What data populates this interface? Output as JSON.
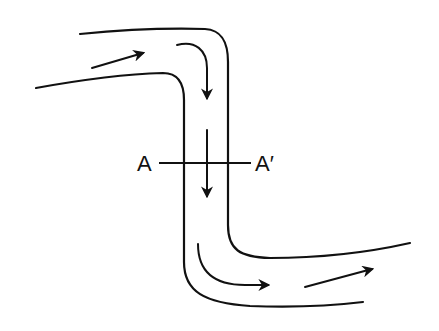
{
  "diagram": {
    "section_labels": {
      "left": "A",
      "right": "A′"
    },
    "elements": [
      {
        "name": "channel-wall-left",
        "kind": "channel boundary"
      },
      {
        "name": "channel-wall-right",
        "kind": "channel boundary"
      },
      {
        "name": "flow-arrow-inlet",
        "kind": "flow direction"
      },
      {
        "name": "flow-arrow-bend-top",
        "kind": "flow direction"
      },
      {
        "name": "flow-arrow-down",
        "kind": "flow direction"
      },
      {
        "name": "flow-arrow-bend-bottom",
        "kind": "flow direction"
      },
      {
        "name": "flow-arrow-outlet",
        "kind": "flow direction"
      },
      {
        "name": "cross-section-line",
        "kind": "section A-A′"
      }
    ],
    "colors": {
      "stroke": "#111111",
      "background": "#ffffff"
    }
  }
}
